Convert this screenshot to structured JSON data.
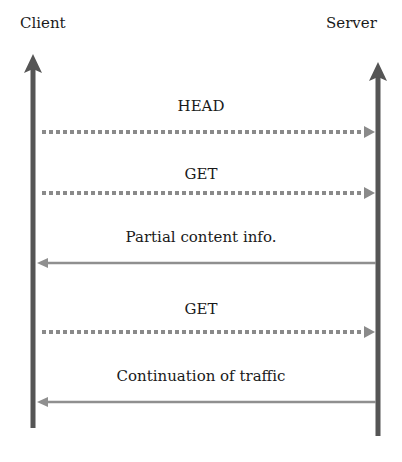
{
  "diagram": {
    "type": "sequence",
    "participants": [
      {
        "id": "client",
        "label": "Client"
      },
      {
        "id": "server",
        "label": "Server"
      }
    ],
    "messages": [
      {
        "label": "HEAD",
        "from": "client",
        "to": "server",
        "style": "dotted"
      },
      {
        "label": "GET",
        "from": "client",
        "to": "server",
        "style": "dotted"
      },
      {
        "label": "Partial content info.",
        "from": "server",
        "to": "client",
        "style": "solid"
      },
      {
        "label": "GET",
        "from": "client",
        "to": "server",
        "style": "dotted"
      },
      {
        "label": "Continuation of traffic",
        "from": "server",
        "to": "client",
        "style": "solid"
      }
    ],
    "colors": {
      "lifeline": "#555555",
      "dotted_arrow": "#8a8a8a",
      "solid_arrow": "#8f8f8f",
      "text": "#1a1a1a"
    }
  }
}
